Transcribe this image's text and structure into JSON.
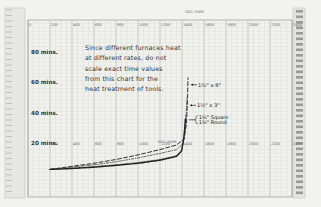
{
  "chart_data": {
    "type": "line",
    "title": "",
    "xlabel": "DEG. FAHR.",
    "ylabel": "mins.",
    "xlim": [
      0,
      2400
    ],
    "ylim": [
      0,
      90
    ],
    "x_ticks": [
      0,
      200,
      400,
      600,
      800,
      1000,
      1200,
      1400,
      1600,
      1800,
      2000,
      2200,
      2400
    ],
    "y_ticks": [
      {
        "value": 20,
        "label": "20 mins."
      },
      {
        "value": 40,
        "label": "40 mins."
      },
      {
        "value": 60,
        "label": "60 mins."
      },
      {
        "value": 80,
        "label": "80 mins."
      }
    ],
    "grid": true,
    "annotation": "Since different furnaces heat at different rates, do not scale exact time values from this chart for the heat treatment of tools.",
    "series": [
      {
        "name": "1½\" x 6\"",
        "style": "dashed",
        "points": [
          [
            200,
            5
          ],
          [
            400,
            7
          ],
          [
            600,
            9
          ],
          [
            800,
            11.5
          ],
          [
            1000,
            14.5
          ],
          [
            1200,
            18
          ],
          [
            1350,
            21
          ],
          [
            1420,
            25
          ],
          [
            1440,
            35
          ],
          [
            1450,
            50
          ],
          [
            1455,
            65
          ]
        ]
      },
      {
        "name": "1½\" x 3\"",
        "style": "dash-dot",
        "points": [
          [
            200,
            5
          ],
          [
            400,
            6.5
          ],
          [
            600,
            8
          ],
          [
            800,
            10
          ],
          [
            1000,
            12.5
          ],
          [
            1200,
            15.5
          ],
          [
            1350,
            18
          ],
          [
            1410,
            22
          ],
          [
            1430,
            32
          ],
          [
            1440,
            45
          ],
          [
            1445,
            52
          ]
        ]
      },
      {
        "name": "1½\" Square",
        "style": "dotted-heavy",
        "points": [
          [
            200,
            5
          ],
          [
            400,
            5.8
          ],
          [
            600,
            6.8
          ],
          [
            800,
            8
          ],
          [
            1000,
            9.5
          ],
          [
            1200,
            11.5
          ],
          [
            1350,
            14
          ],
          [
            1400,
            18
          ],
          [
            1420,
            26
          ],
          [
            1430,
            34
          ],
          [
            1435,
            40
          ]
        ]
      },
      {
        "name": "1½\" Round",
        "style": "solid-heavy",
        "points": [
          [
            200,
            5
          ],
          [
            400,
            5.6
          ],
          [
            600,
            6.4
          ],
          [
            800,
            7.6
          ],
          [
            1000,
            9
          ],
          [
            1200,
            11
          ],
          [
            1350,
            13.5
          ],
          [
            1395,
            17
          ],
          [
            1415,
            25
          ],
          [
            1425,
            33
          ],
          [
            1430,
            38
          ]
        ]
      }
    ],
    "legend_labels": [
      "1½\" x 6\"",
      "1½\" x 3\"",
      "1½\" Square",
      "1½\" Round"
    ]
  },
  "labels": {
    "axis_top_title": "DEG. FAHR.",
    "axis_mid_title": "DEG. FAHR.",
    "note_lines": [
      "Since different furnaces heat",
      "at different rates, do not",
      "scale exact time values",
      "from this chart for the",
      "heat treatment of tools."
    ],
    "y_labels": [
      "80 mins.",
      "60 mins.",
      "40 mins.",
      "20 mins."
    ],
    "x_tick_labels": [
      "0",
      "200",
      "400",
      "600",
      "800",
      "1000",
      "1200",
      "1400",
      "1600",
      "1800",
      "2000",
      "2200",
      "2400"
    ],
    "curve_labels": {
      "a": "1½\" x 6\"",
      "b": "1½\" x 3\"",
      "c1": "1½\" Square",
      "c2": "1½\" Round"
    }
  }
}
